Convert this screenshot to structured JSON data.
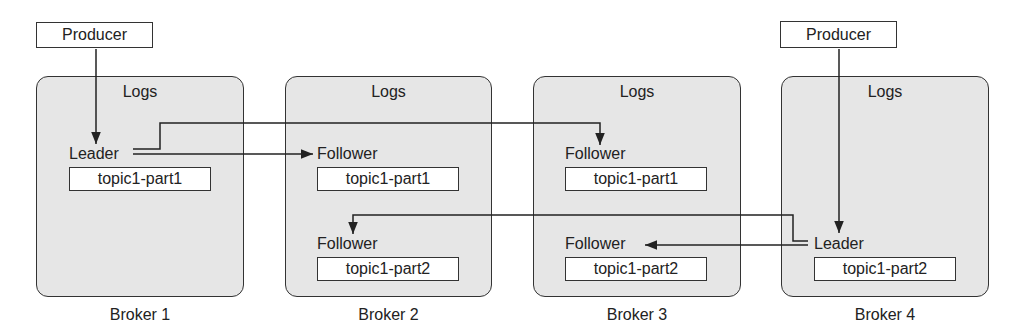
{
  "producers": [
    {
      "label": "Producer",
      "target_broker": "Broker 1"
    },
    {
      "label": "Producer",
      "target_broker": "Broker 4"
    }
  ],
  "brokers": [
    {
      "label": "Broker 1",
      "logs_title": "Logs",
      "replicas": [
        {
          "role": "Leader",
          "partition": "topic1-part1"
        }
      ]
    },
    {
      "label": "Broker 2",
      "logs_title": "Logs",
      "replicas": [
        {
          "role": "Follower",
          "partition": "topic1-part1"
        },
        {
          "role": "Follower",
          "partition": "topic1-part2"
        }
      ]
    },
    {
      "label": "Broker 3",
      "logs_title": "Logs",
      "replicas": [
        {
          "role": "Follower",
          "partition": "topic1-part1"
        },
        {
          "role": "Follower",
          "partition": "topic1-part2"
        }
      ]
    },
    {
      "label": "Broker 4",
      "logs_title": "Logs",
      "replicas": [
        {
          "role": "Leader",
          "partition": "topic1-part2"
        }
      ]
    }
  ],
  "replication_edges": [
    {
      "from": "Broker 1 Leader topic1-part1",
      "to": "Broker 2 Follower topic1-part1"
    },
    {
      "from": "Broker 1 Leader topic1-part1",
      "to": "Broker 3 Follower topic1-part1"
    },
    {
      "from": "Broker 4 Leader topic1-part2",
      "to": "Broker 2 Follower topic1-part2"
    },
    {
      "from": "Broker 4 Leader topic1-part2",
      "to": "Broker 3 Follower topic1-part2"
    }
  ],
  "colors": {
    "broker_fill": "#e6e6e6",
    "stroke": "#333333",
    "box_fill": "#ffffff"
  }
}
